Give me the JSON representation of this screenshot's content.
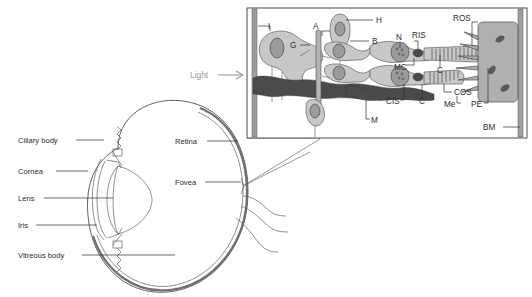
{
  "figure": {
    "background_color": "#ffffff",
    "label_color": "#2b2b2b",
    "light_label_color": "#9a9a9a"
  },
  "eye_diagram": {
    "labels_left": [
      {
        "id": "ciliary-body",
        "text": "Ciliary body",
        "x": 18,
        "y": 143,
        "leader_x1": 76,
        "leader_x2": 104,
        "leader_y": 140
      },
      {
        "id": "cornea",
        "text": "Cornea",
        "x": 18,
        "y": 174,
        "leader_x1": 56,
        "leader_x2": 88,
        "leader_y": 171
      },
      {
        "id": "lens",
        "text": "Lens",
        "x": 18,
        "y": 201,
        "leader_x1": 44,
        "leader_x2": 113,
        "leader_y": 198
      },
      {
        "id": "iris",
        "text": "Iris",
        "x": 18,
        "y": 228,
        "leader_x1": 36,
        "leader_x2": 97,
        "leader_y": 225
      },
      {
        "id": "vitreous-body",
        "text": "Vitreous body",
        "x": 18,
        "y": 258,
        "leader_x1": 82,
        "leader_x2": 175,
        "leader_y": 255
      }
    ],
    "labels_right": [
      {
        "id": "retina",
        "text": "Retina",
        "x": 175,
        "y": 144,
        "leader_x1": 207,
        "leader_x2": 238,
        "leader_y": 141
      },
      {
        "id": "fovea",
        "text": "Fovea",
        "x": 175,
        "y": 185,
        "leader_x1": 205,
        "leader_x2": 241,
        "leader_y": 182
      }
    ]
  },
  "inset": {
    "light": {
      "text": "Light",
      "x": 190,
      "y": 78,
      "arrow_x1": 218,
      "arrow_x2": 244,
      "arrow_y": 75
    },
    "frame": {
      "x": 247,
      "y": 8,
      "width": 280,
      "height": 130
    },
    "labels": [
      {
        "id": "I",
        "text": "I",
        "x": 268,
        "y": 29
      },
      {
        "id": "A",
        "text": "A",
        "x": 315,
        "y": 34
      },
      {
        "id": "G",
        "text": "G",
        "x": 295,
        "y": 48
      },
      {
        "id": "H",
        "text": "H",
        "x": 376,
        "y": 17
      },
      {
        "id": "B",
        "text": "B",
        "x": 372,
        "y": 44
      },
      {
        "id": "N",
        "text": "N",
        "x": 398,
        "y": 39
      },
      {
        "id": "RIS",
        "text": "RIS",
        "x": 419,
        "y": 38
      },
      {
        "id": "ROS",
        "text": "ROS",
        "x": 457,
        "y": 19
      },
      {
        "id": "MC",
        "text": "MC",
        "x": 398,
        "y": 68
      },
      {
        "id": "C-upper",
        "text": "C",
        "x": 436,
        "y": 70
      },
      {
        "id": "COS",
        "text": "COS",
        "x": 431,
        "y": 95
      },
      {
        "id": "CIS",
        "text": "CIS",
        "x": 390,
        "y": 103
      },
      {
        "id": "C-lower",
        "text": "C",
        "x": 419,
        "y": 102
      },
      {
        "id": "M",
        "text": "M",
        "x": 371,
        "y": 122
      },
      {
        "id": "Me",
        "text": "Me",
        "x": 447,
        "y": 106
      },
      {
        "id": "PE",
        "text": "PE",
        "x": 474,
        "y": 106
      },
      {
        "id": "BM",
        "text": "BM",
        "x": 483,
        "y": 130
      }
    ]
  }
}
